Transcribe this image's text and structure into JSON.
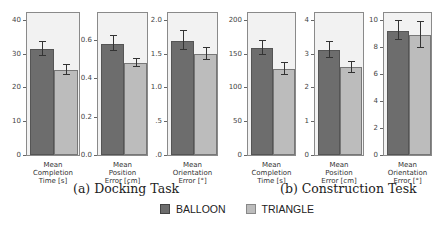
{
  "chart_data": [
    {
      "type": "bar",
      "title": "Mean Completion Time [s]",
      "group": "(a) Docking Task",
      "categories": [
        "Mean Completion Time [s]"
      ],
      "series": [
        {
          "name": "BALLOON",
          "values": [
            31.3
          ],
          "error": [
            2.1
          ]
        },
        {
          "name": "TRIANGLE",
          "values": [
            25.2
          ],
          "error": [
            1.5
          ]
        }
      ],
      "ylim": [
        0,
        42
      ],
      "yticks": [
        0,
        10,
        20,
        30,
        40
      ]
    },
    {
      "type": "bar",
      "title": "Mean Position Error [cm]",
      "group": "(a) Docking Task",
      "categories": [
        "Mean Position Error [cm]"
      ],
      "series": [
        {
          "name": "BALLOON",
          "values": [
            0.58
          ],
          "error": [
            0.04
          ]
        },
        {
          "name": "TRIANGLE",
          "values": [
            0.48
          ],
          "error": [
            0.02
          ]
        }
      ],
      "ylim": [
        0,
        0.74
      ],
      "yticks": [
        "0.0",
        "0.2",
        "0.4",
        "0.6"
      ]
    },
    {
      "type": "bar",
      "title": "Mean Orientation Error [°]",
      "group": "(a) Docking Task",
      "categories": [
        "Mean Orientation Error [°]"
      ],
      "series": [
        {
          "name": "BALLOON",
          "values": [
            1.69
          ],
          "error": [
            0.14
          ]
        },
        {
          "name": "TRIANGLE",
          "values": [
            1.49
          ],
          "error": [
            0.09
          ]
        }
      ],
      "ylim": [
        0,
        2.1
      ],
      "yticks": [
        "0",
        "0.5",
        "1.0",
        "1.5",
        "2.0"
      ]
    },
    {
      "type": "bar",
      "title": "Mean Completion Time [s]",
      "group": "(b) Construction Tesk",
      "categories": [
        "Mean Completion Time [s]"
      ],
      "series": [
        {
          "name": "BALLOON",
          "values": [
            158
          ],
          "error": [
            10
          ]
        },
        {
          "name": "TRIANGLE",
          "values": [
            127
          ],
          "error": [
            9
          ]
        }
      ],
      "ylim": [
        0,
        210
      ],
      "yticks": [
        0,
        50,
        100,
        150,
        200
      ]
    },
    {
      "type": "bar",
      "title": "Mean Position Error [cm]",
      "group": "(b) Construction Tesk",
      "categories": [
        "Mean Position Error [cm]"
      ],
      "series": [
        {
          "name": "BALLOON",
          "values": [
            3.1
          ],
          "error": [
            0.23
          ]
        },
        {
          "name": "TRIANGLE",
          "values": [
            2.6
          ],
          "error": [
            0.16
          ]
        }
      ],
      "ylim": [
        0,
        4.2
      ],
      "yticks": [
        0,
        1,
        2,
        3,
        4
      ]
    },
    {
      "type": "bar",
      "title": "Mean Orientation Error [°]",
      "group": "(b) Construction Tesk",
      "categories": [
        "Mean Orientation Error [°]"
      ],
      "series": [
        {
          "name": "BALLOON",
          "values": [
            9.2
          ],
          "error": [
            0.7
          ]
        },
        {
          "name": "TRIANGLE",
          "values": [
            8.9
          ],
          "error": [
            0.95
          ]
        }
      ],
      "ylim": [
        0,
        10.5
      ],
      "yticks": [
        0,
        2,
        4,
        6,
        8,
        10
      ]
    }
  ],
  "panels": [
    {
      "left": 26,
      "width": 54,
      "ymax": 42,
      "ticks": [
        {
          "v": 0,
          "l": "0"
        },
        {
          "v": 10,
          "l": "10"
        },
        {
          "v": 20,
          "l": "20"
        },
        {
          "v": 30,
          "l": "30"
        },
        {
          "v": 40,
          "l": "40"
        }
      ],
      "b": 31.3,
      "be": 2.1,
      "t": 25.2,
      "te": 1.5,
      "label": [
        "Mean",
        "Completion",
        "Time [s]"
      ]
    },
    {
      "left": 97,
      "width": 51,
      "ymax": 0.74,
      "ticks": [
        {
          "v": 0,
          "l": "0.0"
        },
        {
          "v": 0.2,
          "l": "0.2"
        },
        {
          "v": 0.4,
          "l": "0.4"
        },
        {
          "v": 0.6,
          "l": "0.6"
        }
      ],
      "b": 0.58,
      "be": 0.04,
      "t": 0.48,
      "te": 0.02,
      "label": [
        "Mean",
        "Position",
        "Error [cm]"
      ]
    },
    {
      "left": 167,
      "width": 51,
      "ymax": 2.1,
      "ticks": [
        {
          "v": 0,
          "l": ".0"
        },
        {
          "v": 0.5,
          "l": ".5"
        },
        {
          "v": 1.0,
          "l": "1.0"
        },
        {
          "v": 1.5,
          "l": "1.5"
        },
        {
          "v": 2.0,
          "l": "2.0"
        }
      ],
      "b": 1.69,
      "be": 0.14,
      "t": 1.49,
      "te": 0.09,
      "label": [
        "Mean",
        "Orientation",
        "Error [°]"
      ]
    },
    {
      "left": 247,
      "width": 49,
      "ymax": 210,
      "ticks": [
        {
          "v": 0,
          "l": "0"
        },
        {
          "v": 50,
          "l": "50"
        },
        {
          "v": 100,
          "l": "100"
        },
        {
          "v": 150,
          "l": "150"
        },
        {
          "v": 200,
          "l": "200"
        }
      ],
      "b": 158,
      "be": 10,
      "t": 127,
      "te": 9,
      "label": [
        "Mean",
        "Completion",
        "Time [s]"
      ]
    },
    {
      "left": 314,
      "width": 50,
      "ymax": 4.2,
      "ticks": [
        {
          "v": 0,
          "l": "0"
        },
        {
          "v": 1,
          "l": "1"
        },
        {
          "v": 2,
          "l": "2"
        },
        {
          "v": 3,
          "l": "3"
        },
        {
          "v": 4,
          "l": "4"
        }
      ],
      "b": 3.1,
      "be": 0.23,
      "t": 2.6,
      "te": 0.16,
      "label": [
        "Mean",
        "Position",
        "Error [cm]"
      ]
    },
    {
      "left": 383,
      "width": 49,
      "ymax": 10.5,
      "ticks": [
        {
          "v": 0,
          "l": "0"
        },
        {
          "v": 2,
          "l": "2"
        },
        {
          "v": 4,
          "l": "4"
        },
        {
          "v": 6,
          "l": "6"
        },
        {
          "v": 8,
          "l": "8"
        },
        {
          "v": 10,
          "l": "10"
        }
      ],
      "b": 9.2,
      "be": 0.7,
      "t": 8.9,
      "te": 0.95,
      "label": [
        "Mean",
        "Orientation",
        "Error [°]"
      ]
    }
  ],
  "captions": {
    "a": "(a) Docking Task",
    "b": "(b) Construction Tesk"
  },
  "legend": {
    "balloon": "BALLOON",
    "triangle": "TRIANGLE",
    "balloon_color": "#6d6d6d",
    "triangle_color": "#bcbcbc"
  }
}
